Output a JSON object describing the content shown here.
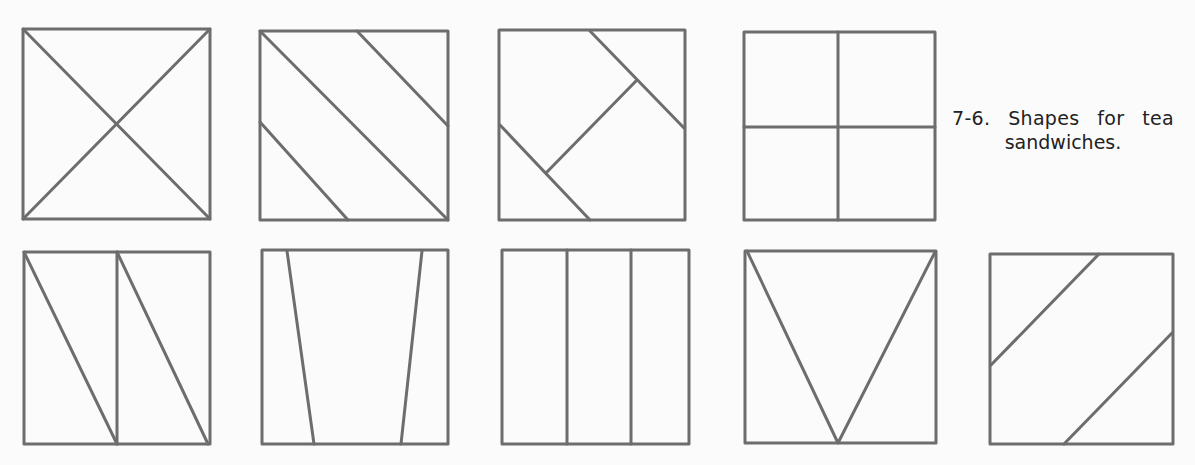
{
  "figure": {
    "number": "7-6.",
    "caption_line1": "7-6. Shapes for tea",
    "caption_line2": "sandwiches.",
    "line_color": "#6d6d6d",
    "background_color": "#fbfbfb"
  },
  "shapes": [
    {
      "id": 1,
      "row": 1,
      "description": "square cut diagonally both ways into four triangles"
    },
    {
      "id": 2,
      "row": 1,
      "description": "square cut into three diagonal strips"
    },
    {
      "id": 3,
      "row": 1,
      "description": "square cut with diagonal lines and perpendicular connector"
    },
    {
      "id": 4,
      "row": 1,
      "description": "square cut into four smaller squares"
    },
    {
      "id": 5,
      "row": 2,
      "description": "square cut in half vertically, each half cut diagonally"
    },
    {
      "id": 6,
      "row": 2,
      "description": "square cut into trapezoid center with two tapered side strips"
    },
    {
      "id": 7,
      "row": 2,
      "description": "square cut into three vertical fingers"
    },
    {
      "id": 8,
      "row": 2,
      "description": "square cut into V-shaped triangles"
    },
    {
      "id": 9,
      "row": 2,
      "description": "square cut into three parallel diagonal strips"
    }
  ]
}
